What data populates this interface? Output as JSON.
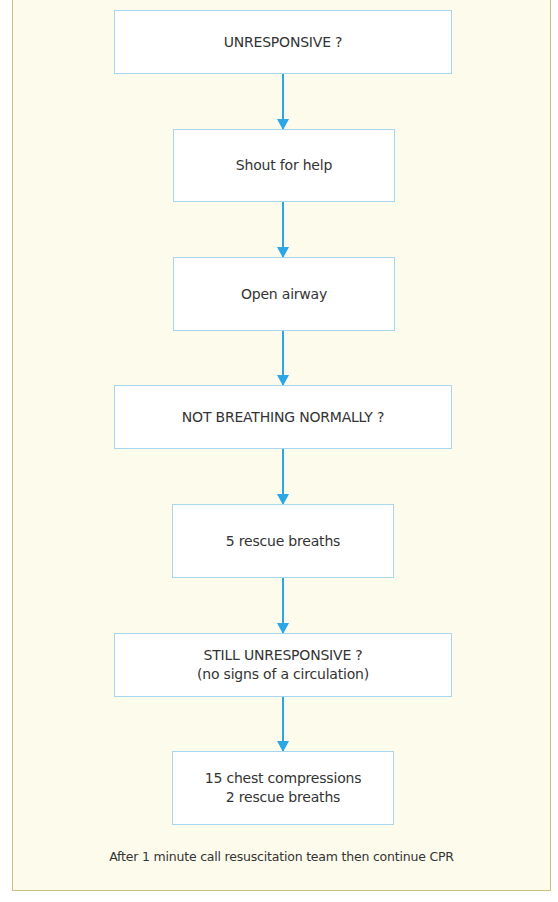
{
  "flowchart": {
    "steps": [
      {
        "id": "unresponsive",
        "lines": [
          "UNRESPONSIVE ?"
        ]
      },
      {
        "id": "shout-for-help",
        "lines": [
          "Shout for help"
        ]
      },
      {
        "id": "open-airway",
        "lines": [
          "Open airway"
        ]
      },
      {
        "id": "not-breathing-normally",
        "lines": [
          "NOT BREATHING NORMALLY ?"
        ]
      },
      {
        "id": "rescue-breaths",
        "lines": [
          "5 rescue breaths"
        ]
      },
      {
        "id": "still-unresponsive",
        "lines": [
          "STILL UNRESPONSIVE ?",
          "(no signs of a circulation)"
        ]
      },
      {
        "id": "compressions",
        "lines": [
          "15 chest compressions",
          "2 rescue breaths"
        ]
      }
    ],
    "footer": "After 1 minute call resuscitation team then continue CPR"
  },
  "colors": {
    "panel_background": "#fdfcec",
    "panel_border": "#c9c27a",
    "box_border": "#a8d6ee",
    "arrow": "#2aa7e4",
    "text": "#333333"
  }
}
